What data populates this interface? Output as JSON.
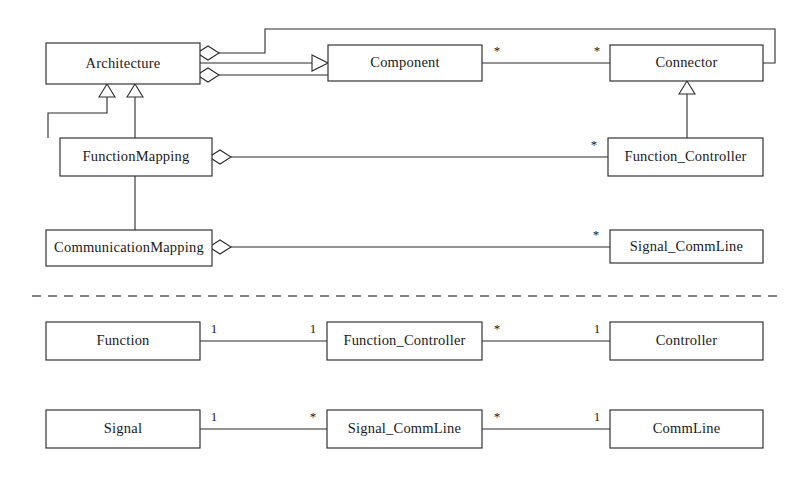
{
  "diagram": {
    "type": "uml-class-diagram",
    "background_color": "#ffffff",
    "line_color": "#2b2b2b",
    "separator": {
      "name": "section-divider",
      "style": "dashed",
      "y": 296,
      "x_start": 32,
      "x_end": 780
    },
    "sections": [
      {
        "id": "upper",
        "name": "architecture-section"
      },
      {
        "id": "lower",
        "name": "mapping-section"
      }
    ],
    "classes": [
      {
        "id": "architecture",
        "label": "Architecture",
        "x": 46,
        "y": 43,
        "w": 154,
        "h": 41,
        "section": "upper"
      },
      {
        "id": "component",
        "label": "Component",
        "x": 328,
        "y": 45,
        "w": 154,
        "h": 36,
        "section": "upper"
      },
      {
        "id": "connector",
        "label": "Connector",
        "x": 610,
        "y": 45,
        "w": 153,
        "h": 36,
        "section": "upper"
      },
      {
        "id": "function_mapping",
        "label": "FunctionMapping",
        "x": 60,
        "y": 138,
        "w": 152,
        "h": 38,
        "section": "upper"
      },
      {
        "id": "function_controller",
        "label": "Function_Controller",
        "x": 608,
        "y": 138,
        "w": 155,
        "h": 38,
        "section": "upper"
      },
      {
        "id": "comm_mapping",
        "label": "CommunicationMapping",
        "x": 46,
        "y": 230,
        "w": 166,
        "h": 36,
        "section": "upper"
      },
      {
        "id": "signal_commline_up",
        "label": "Signal_CommLine",
        "x": 610,
        "y": 230,
        "w": 153,
        "h": 33,
        "section": "upper"
      },
      {
        "id": "function",
        "label": "Function",
        "x": 46,
        "y": 322,
        "w": 154,
        "h": 38,
        "section": "lower"
      },
      {
        "id": "function_ctrl_low",
        "label": "Function_Controller",
        "x": 327,
        "y": 322,
        "w": 155,
        "h": 38,
        "section": "lower"
      },
      {
        "id": "controller",
        "label": "Controller",
        "x": 610,
        "y": 322,
        "w": 153,
        "h": 38,
        "section": "lower"
      },
      {
        "id": "signal",
        "label": "Signal",
        "x": 46,
        "y": 410,
        "w": 154,
        "h": 38,
        "section": "lower"
      },
      {
        "id": "signal_commline_low",
        "label": "Signal_CommLine",
        "x": 327,
        "y": 410,
        "w": 155,
        "h": 38,
        "section": "lower"
      },
      {
        "id": "commline",
        "label": "CommLine",
        "x": 610,
        "y": 410,
        "w": 153,
        "h": 38,
        "section": "lower"
      }
    ],
    "relationships": [
      {
        "id": "arch-aggregates-connector",
        "name": "architecture-aggregation-connector",
        "kind": "aggregation",
        "from": "architecture",
        "to": "connector",
        "path": "M 216 53 L 265 53 L 265 29 L 775 29 L 775 63 L 763 63",
        "diamond": {
          "cx": 208,
          "cy": 53,
          "rx": 11,
          "ry": 7
        }
      },
      {
        "id": "arch-generalizes-component",
        "name": "architecture-generalization-component",
        "kind": "generalization",
        "from": "architecture",
        "to": "component",
        "path": "M 200 63 L 312 63",
        "triangle": "M 312 55 L 328 63 L 312 71 Z"
      },
      {
        "id": "arch-aggregates-component",
        "name": "architecture-aggregation-component",
        "kind": "aggregation",
        "from": "architecture",
        "to": "component",
        "path": "M 219 75 L 328 75",
        "diamond": {
          "cx": 208,
          "cy": 75,
          "rx": 11,
          "ry": 7
        }
      },
      {
        "id": "component-connector",
        "name": "component-connector-association",
        "kind": "association",
        "from": "component",
        "to": "connector",
        "path": "M 482 63 L 610 63",
        "labels": [
          {
            "text": "*",
            "x": 497,
            "y": 55
          },
          {
            "text": "*",
            "x": 597,
            "y": 55
          }
        ]
      },
      {
        "id": "fm-generalizes-arch",
        "name": "functionmapping-generalization-architecture",
        "kind": "generalization",
        "from": "function_mapping",
        "to": "architecture",
        "path": "M 48 138 L 48 113 L 107 113 L 107 97",
        "triangle": "M 99 97 L 107 84 L 115 97 Z"
      },
      {
        "id": "cm-generalizes-arch",
        "name": "communicationmapping-generalization-architecture",
        "kind": "generalization",
        "from": "comm_mapping",
        "to": "architecture",
        "path": "M 135 230 L 135 97",
        "triangle": "M 127 97 L 135 84 L 143 97 Z"
      },
      {
        "id": "fm-aggregates-fc",
        "name": "functionmapping-aggregation-functioncontroller",
        "kind": "aggregation",
        "from": "function_mapping",
        "to": "function_controller",
        "path": "M 231 157 L 608 157",
        "diamond": {
          "cx": 220,
          "cy": 157,
          "rx": 11,
          "ry": 7
        },
        "labels": [
          {
            "text": "*",
            "x": 594,
            "y": 149
          }
        ]
      },
      {
        "id": "fc-generalizes-connector",
        "name": "functioncontroller-generalization-connector",
        "kind": "generalization",
        "from": "function_controller",
        "to": "connector",
        "path": "M 687 138 L 687 94",
        "triangle": "M 679 94 L 687 81 L 695 94 Z"
      },
      {
        "id": "cm-aggregates-scl",
        "name": "communicationmapping-aggregation-signalcommline",
        "kind": "aggregation",
        "from": "comm_mapping",
        "to": "signal_commline_up",
        "path": "M 231 247 L 610 247",
        "diamond": {
          "cx": 220,
          "cy": 247,
          "rx": 11,
          "ry": 7
        },
        "labels": [
          {
            "text": "*",
            "x": 596,
            "y": 239
          }
        ]
      },
      {
        "id": "function-fc",
        "name": "function-functioncontroller-association",
        "kind": "association",
        "from": "function",
        "to": "function_ctrl_low",
        "path": "M 200 341 L 327 341",
        "labels": [
          {
            "text": "1",
            "x": 214,
            "y": 333
          },
          {
            "text": "1",
            "x": 313,
            "y": 333
          }
        ]
      },
      {
        "id": "fc-controller",
        "name": "functioncontroller-controller-association",
        "kind": "association",
        "from": "function_ctrl_low",
        "to": "controller",
        "path": "M 482 341 L 610 341",
        "labels": [
          {
            "text": "*",
            "x": 497,
            "y": 333
          },
          {
            "text": "1",
            "x": 597,
            "y": 333
          }
        ]
      },
      {
        "id": "signal-scl",
        "name": "signal-signalcommline-association",
        "kind": "association",
        "from": "signal",
        "to": "signal_commline_low",
        "path": "M 200 429 L 327 429",
        "labels": [
          {
            "text": "1",
            "x": 214,
            "y": 421
          },
          {
            "text": "*",
            "x": 313,
            "y": 421
          }
        ]
      },
      {
        "id": "scl-commline",
        "name": "signalcommline-commline-association",
        "kind": "association",
        "from": "signal_commline_low",
        "to": "commline",
        "path": "M 482 429 L 610 429",
        "labels": [
          {
            "text": "*",
            "x": 497,
            "y": 421
          },
          {
            "text": "1",
            "x": 597,
            "y": 421
          }
        ]
      }
    ]
  }
}
